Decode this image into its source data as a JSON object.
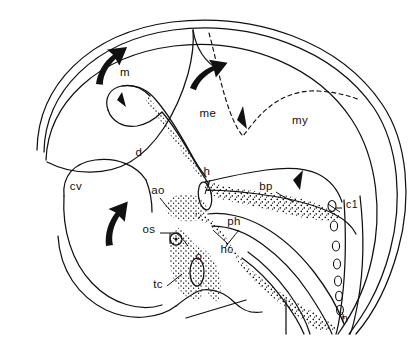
{
  "figure": {
    "type": "anatomical-line-diagram",
    "background_color": "#ffffff",
    "ink_color": "#111111",
    "stipple_color": "#111111"
  },
  "labels": [
    {
      "id": "m",
      "text": "m",
      "x": 125,
      "y": 76,
      "meaning": "mesencephalon-arrow-label"
    },
    {
      "id": "me",
      "text": "me",
      "x": 208,
      "y": 117,
      "meaning": "metencephalon"
    },
    {
      "id": "my",
      "text": "my",
      "x": 300,
      "y": 124,
      "meaning": "myelencephalon"
    },
    {
      "id": "d",
      "text": "d",
      "x": 139,
      "y": 156,
      "meaning": "diencephalon"
    },
    {
      "id": "cv",
      "text": "cv",
      "x": 76,
      "y": 190,
      "meaning": "cerebral-vesicle"
    },
    {
      "id": "h",
      "text": "h",
      "x": 207,
      "y": 175,
      "meaning": "heart"
    },
    {
      "id": "bp",
      "text": "bp",
      "x": 266,
      "y": 190,
      "meaning": "bulbus-pharynx"
    },
    {
      "id": "ao",
      "text": "ao",
      "x": 158,
      "y": 194,
      "meaning": "aorta"
    },
    {
      "id": "c1",
      "text": "c1",
      "x": 346,
      "y": 208,
      "meaning": "first-cervical-somite"
    },
    {
      "id": "os",
      "text": "os",
      "x": 149,
      "y": 233,
      "meaning": "optic-stalk"
    },
    {
      "id": "ph",
      "text": "ph",
      "x": 234,
      "y": 225,
      "meaning": "pharynx"
    },
    {
      "id": "hc",
      "text": "hc",
      "x": 227,
      "y": 253,
      "meaning": "head-cavity"
    },
    {
      "id": "o",
      "text": "o",
      "x": 199,
      "y": 260,
      "meaning": "otic-vesicle"
    },
    {
      "id": "tc",
      "text": "tc",
      "x": 158,
      "y": 288,
      "meaning": "truncus-cordis"
    },
    {
      "id": "n",
      "text": "n",
      "x": 345,
      "y": 318,
      "meaning": "notochord"
    }
  ],
  "arrows": [
    {
      "id": "arrow-m",
      "style": "solid-curved-bold",
      "direction": "up-right",
      "near_label": "m"
    },
    {
      "id": "arrow-me",
      "style": "solid-curved-bold",
      "direction": "up-right",
      "near_label": "me"
    },
    {
      "id": "arrow-cv",
      "style": "solid-curved-bold",
      "direction": "up-left",
      "near_label": "cv"
    },
    {
      "id": "arrowhead-d",
      "style": "small-solid-triangle",
      "near_label": "d"
    },
    {
      "id": "arrowhead-me",
      "style": "small-solid-triangle",
      "near_label": "me"
    },
    {
      "id": "arrowhead-bp",
      "style": "small-solid-triangle",
      "near_label": "bp"
    }
  ],
  "line_styles": {
    "body_outline": "double-solid-thin",
    "brain_boundary": "dashed",
    "mesenchyme": "stippled"
  },
  "somites": {
    "count": 7,
    "shape": "small-ellipse",
    "label": "c1"
  }
}
